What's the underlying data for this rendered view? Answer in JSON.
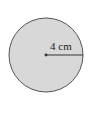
{
  "diagram": {
    "shape": "circle",
    "radius_label": "4 cm",
    "colors": {
      "fill": "#d8d8d8",
      "stroke": "#555555",
      "line": "#333333"
    }
  }
}
